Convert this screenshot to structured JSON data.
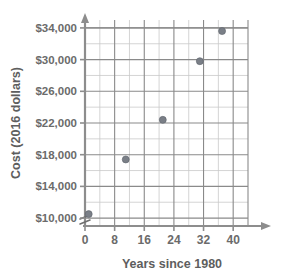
{
  "chart_data": {
    "type": "scatter",
    "title": "",
    "xlabel": "Years since 1980",
    "ylabel": "Cost (2016 dollars)",
    "xlim": [
      0,
      44
    ],
    "ylim": [
      9000,
      35000
    ],
    "x_ticks": [
      0,
      8,
      16,
      24,
      32,
      40
    ],
    "x_tick_labels": [
      "0",
      "8",
      "16",
      "24",
      "32",
      "40"
    ],
    "x_minor_step": 4,
    "y_ticks": [
      10000,
      14000,
      18000,
      22000,
      26000,
      30000,
      34000
    ],
    "y_tick_labels": [
      "$10,000",
      "$14,000",
      "$18,000",
      "$22,000",
      "$26,000",
      "$30,000",
      "$34,000"
    ],
    "y_minor_step": 2000,
    "grid": true,
    "legend": false,
    "axis_break": {
      "axis": "y",
      "below_value": 10000,
      "symbol": "zigzag"
    },
    "marker": {
      "shape": "circle",
      "color": "#7a7f87",
      "size": 7
    },
    "points": [
      {
        "x": 1,
        "y": 10500
      },
      {
        "x": 11,
        "y": 17400
      },
      {
        "x": 21,
        "y": 22400
      },
      {
        "x": 31,
        "y": 29800
      },
      {
        "x": 37,
        "y": 33600
      }
    ]
  },
  "axes": {
    "x_title": "Years since 1980",
    "y_title": "Cost (2016 dollars)"
  },
  "colors": {
    "marker": "#7a7f87",
    "grid_major": "#8a8a8a",
    "grid_minor": "#c9c9c9",
    "axis": "#8d8d8d",
    "text": "#6b6b6b"
  }
}
